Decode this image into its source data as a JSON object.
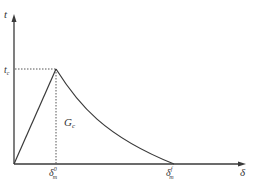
{
  "diagram": {
    "type": "bilinear-exponential traction-separation law",
    "y_axis": {
      "label": "t"
    },
    "x_axis": {
      "label": "δ"
    },
    "peak": {
      "traction_label": "t",
      "traction_sub": "c",
      "separation_label": "δ",
      "separation_sub": "m",
      "separation_sup": "0"
    },
    "final": {
      "separation_label": "δ",
      "separation_sub": "m",
      "separation_sup": "f"
    },
    "area_label": {
      "main": "G",
      "sub": "c"
    },
    "colors": {
      "line": "#3a3a3a",
      "dotted": "#555555",
      "text": "#333333",
      "background": "#ffffff"
    }
  }
}
